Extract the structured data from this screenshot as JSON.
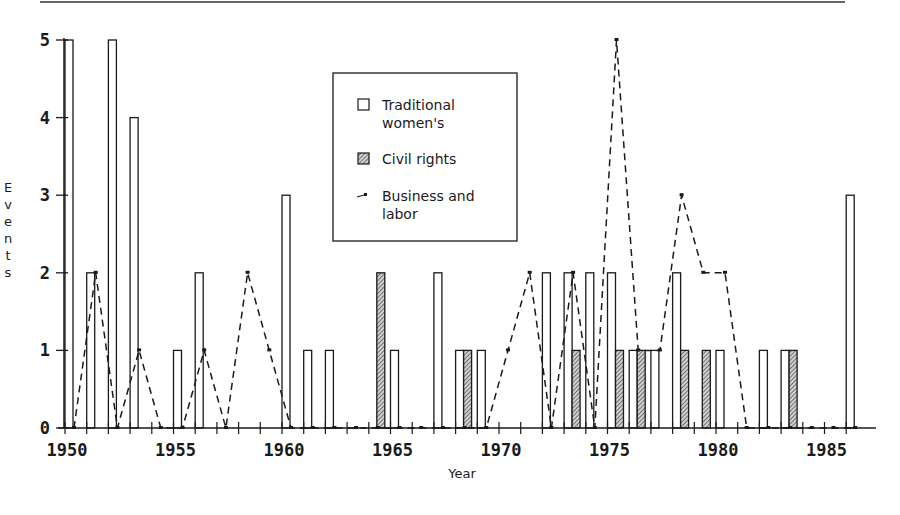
{
  "chart_data": {
    "type": "bar",
    "title": "",
    "xlabel": "Year",
    "ylabel": "Events",
    "xlim": [
      1950,
      1986.5
    ],
    "ylim": [
      0,
      5
    ],
    "x_ticks": [
      1950,
      1955,
      1960,
      1965,
      1970,
      1975,
      1980,
      1985
    ],
    "y_ticks": [
      0,
      1,
      2,
      3,
      4,
      5
    ],
    "y_tick_labels": [
      "0",
      "1",
      "2",
      "3",
      "4",
      "5"
    ],
    "grid": false,
    "legend_position": "top-center",
    "years": [
      1950,
      1951,
      1952,
      1953,
      1954,
      1955,
      1956,
      1957,
      1958,
      1959,
      1960,
      1961,
      1962,
      1963,
      1964,
      1965,
      1966,
      1967,
      1968,
      1969,
      1970,
      1971,
      1972,
      1973,
      1974,
      1975,
      1976,
      1977,
      1978,
      1979,
      1980,
      1981,
      1982,
      1983,
      1984,
      1985,
      1986
    ],
    "series": [
      {
        "name": "Traditional women's",
        "legend_lines": [
          "Traditional",
          "women's"
        ],
        "kind": "bar",
        "style": "open",
        "values": [
          5,
          2,
          5,
          4,
          0,
          1,
          2,
          0,
          0,
          0,
          3,
          1,
          1,
          0,
          0,
          1,
          0,
          2,
          1,
          1,
          0,
          0,
          2,
          2,
          2,
          2,
          1,
          1,
          2,
          0,
          1,
          0,
          1,
          1,
          0,
          0,
          3
        ]
      },
      {
        "name": "Civil rights",
        "legend_lines": [
          "Civil rights"
        ],
        "kind": "bar",
        "style": "hatched",
        "values": [
          0,
          0,
          0,
          0,
          0,
          0,
          0,
          0,
          0,
          0,
          0,
          0,
          0,
          0,
          2,
          0,
          0,
          0,
          1,
          0,
          0,
          0,
          0,
          1,
          0,
          1,
          1,
          0,
          1,
          1,
          0,
          0,
          0,
          1,
          0,
          0,
          0
        ]
      },
      {
        "name": "Business and labor",
        "legend_lines": [
          "Business and",
          "labor"
        ],
        "kind": "line",
        "style": "dashed",
        "values": [
          0,
          2,
          0,
          1,
          0,
          0,
          1,
          0,
          2,
          1,
          0,
          0,
          0,
          0,
          0,
          0,
          0,
          0,
          0,
          0,
          1,
          2,
          0,
          2,
          0,
          5,
          1,
          1,
          3,
          2,
          2,
          0,
          0,
          0,
          0,
          0,
          0
        ]
      }
    ]
  },
  "colors": {
    "ink": "#1a1a1a",
    "hatch": "#8a8a8a",
    "background": "#ffffff"
  }
}
